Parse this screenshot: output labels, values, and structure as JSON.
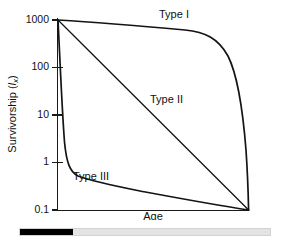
{
  "chart_data": {
    "type": "line",
    "title": "",
    "xlabel": "Age",
    "ylabel": "Survivorship (lx)",
    "ylabel_parts": {
      "prefix": "Survivorship (",
      "symbol": "l",
      "subscript": "x",
      "suffix": ")"
    },
    "y_scale": "log",
    "y_ticks": [
      "1000",
      "100",
      "10",
      "1",
      "0.1"
    ],
    "y_tick_values": [
      1000,
      100,
      10,
      1,
      0.1
    ],
    "ylim": [
      0.1,
      1000
    ],
    "x_ticks": [],
    "xlim": [
      0,
      100
    ],
    "grid": false,
    "legend_position": "inline-annotations",
    "series": [
      {
        "name": "Type I",
        "label": "Type I",
        "label_x": 54,
        "label_y": 960,
        "x": [
          0,
          10,
          20,
          30,
          40,
          50,
          60,
          70,
          78,
          84,
          88,
          91,
          94,
          96,
          98,
          99,
          100
        ],
        "y": [
          1000,
          960,
          930,
          900,
          870,
          840,
          810,
          770,
          720,
          640,
          520,
          380,
          180,
          60,
          8,
          1.2,
          0.1
        ]
      },
      {
        "name": "Type II",
        "label": "Type II",
        "label_x": 50,
        "label_y": 33,
        "x": [
          0,
          10,
          20,
          30,
          40,
          50,
          60,
          70,
          80,
          90,
          100
        ],
        "y": [
          1000,
          398,
          158,
          63,
          25,
          10,
          3.98,
          1.58,
          0.63,
          0.25,
          0.1
        ]
      },
      {
        "name": "Type III",
        "label": "Type III",
        "label_x": 20,
        "label_y": 0.62,
        "x": [
          0,
          1,
          2,
          3,
          4,
          5,
          6,
          8,
          10,
          14,
          20,
          30,
          40,
          55,
          70,
          85,
          95,
          100
        ],
        "y": [
          1000,
          200,
          40,
          10,
          3.2,
          1.5,
          1.0,
          0.72,
          0.6,
          0.5,
          0.44,
          0.38,
          0.33,
          0.27,
          0.21,
          0.16,
          0.12,
          0.1
        ]
      }
    ]
  },
  "progress": {
    "label": "scroll-progress",
    "percent": 21,
    "fill_color": "#000000",
    "track_color": "#e3e3e3"
  }
}
